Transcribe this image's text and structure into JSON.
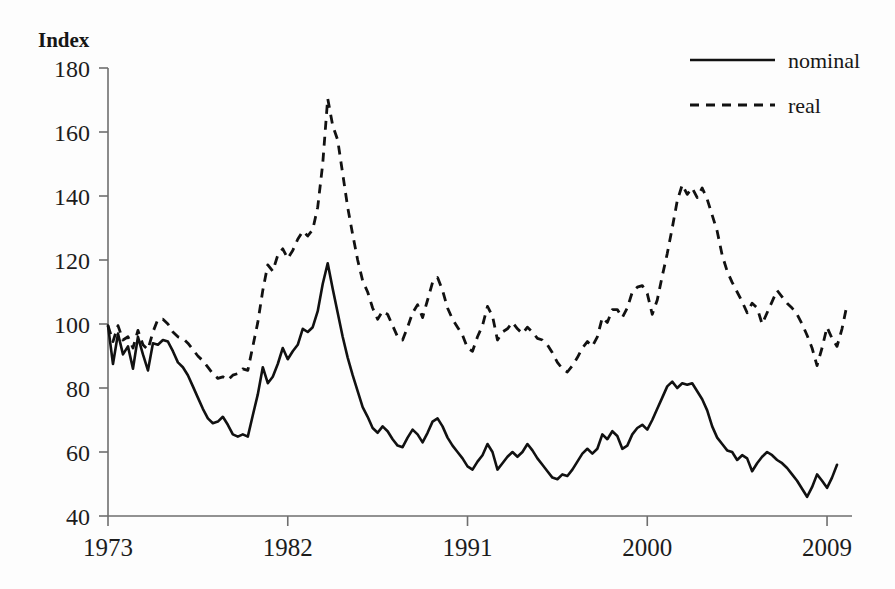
{
  "chart_data": {
    "type": "line",
    "title": "",
    "subtitle": "",
    "ylabel": "Index",
    "xlabel": "",
    "ylim": [
      40,
      180
    ],
    "xlim": [
      1973,
      2010.25
    ],
    "yticks": [
      40,
      60,
      80,
      100,
      120,
      140,
      160,
      180
    ],
    "xticks": [
      1973,
      1982,
      1991,
      2000,
      2009
    ],
    "ytick_labels": [
      "40",
      "60",
      "80",
      "100",
      "120",
      "140",
      "160",
      "180"
    ],
    "xtick_labels": [
      "1973",
      "1982",
      "1991",
      "2000",
      "2009"
    ],
    "grid": false,
    "legend_position": "top-right",
    "legend": [
      "nominal",
      "real"
    ],
    "x_start": 1973.0,
    "x_step": 0.25,
    "series": [
      {
        "name": "nominal",
        "style": "solid",
        "values": [
          99.5,
          87.5,
          97.0,
          90.5,
          93.0,
          86.0,
          96.0,
          90.5,
          85.5,
          94.0,
          93.5,
          95.0,
          94.5,
          91.5,
          88.0,
          86.5,
          84.0,
          80.5,
          77.0,
          73.5,
          70.5,
          69.0,
          69.5,
          71.0,
          68.5,
          65.5,
          64.8,
          65.5,
          64.8,
          71.5,
          78.0,
          86.5,
          81.5,
          83.5,
          87.5,
          92.5,
          89.0,
          91.5,
          93.5,
          98.5,
          97.5,
          99.0,
          104.0,
          112.5,
          119.0,
          111.0,
          103.5,
          96.0,
          89.5,
          84.0,
          79.0,
          74.0,
          71.0,
          67.5,
          66.0,
          68.0,
          66.5,
          64.0,
          62.0,
          61.5,
          64.5,
          67.0,
          65.5,
          63.0,
          66.0,
          69.5,
          70.5,
          68.0,
          64.5,
          62.0,
          60.0,
          58.0,
          55.5,
          54.5,
          57.0,
          59.0,
          62.5,
          60.0,
          54.5,
          56.5,
          58.5,
          60.0,
          58.5,
          60.0,
          62.5,
          60.5,
          58.0,
          56.0,
          54.0,
          52.0,
          51.5,
          53.0,
          52.5,
          54.5,
          57.0,
          59.5,
          61.0,
          59.5,
          61.0,
          65.5,
          64.0,
          66.5,
          65.0,
          61.0,
          62.0,
          65.5,
          67.5,
          68.5,
          67.0,
          70.0,
          73.5,
          77.0,
          80.5,
          82.0,
          80.0,
          81.5,
          81.0,
          81.5,
          79.0,
          76.5,
          73.0,
          68.0,
          64.5,
          62.5,
          60.5,
          60.0,
          57.5,
          59.0,
          58.0,
          54.0,
          56.5,
          58.5,
          60.0,
          59.0,
          57.5,
          56.5,
          55.0,
          53.0,
          51.0,
          48.5,
          46.0,
          49.0,
          53.0,
          51.0,
          48.8,
          52.0,
          56.0
        ]
      },
      {
        "name": "real",
        "style": "dashed",
        "values": [
          99.5,
          94.5,
          99.5,
          95.0,
          96.0,
          92.5,
          98.0,
          93.5,
          92.0,
          97.5,
          101.5,
          101.5,
          100.0,
          97.5,
          96.0,
          95.5,
          94.0,
          92.0,
          90.0,
          88.5,
          86.5,
          84.5,
          83.0,
          83.5,
          82.5,
          84.0,
          84.5,
          86.0,
          85.5,
          93.0,
          100.5,
          110.5,
          118.5,
          116.5,
          121.5,
          123.5,
          120.5,
          123.0,
          126.5,
          129.0,
          127.5,
          129.5,
          136.5,
          150.0,
          170.5,
          162.0,
          157.5,
          147.0,
          136.5,
          128.0,
          120.0,
          113.5,
          110.0,
          105.0,
          101.5,
          104.0,
          103.0,
          99.5,
          96.0,
          95.0,
          99.0,
          103.5,
          106.0,
          102.0,
          107.5,
          113.0,
          114.5,
          110.5,
          105.0,
          101.5,
          99.0,
          96.5,
          92.5,
          91.5,
          96.0,
          99.5,
          105.5,
          102.5,
          95.0,
          97.5,
          98.5,
          100.5,
          98.5,
          97.0,
          99.0,
          97.5,
          95.5,
          95.0,
          93.5,
          91.0,
          88.0,
          86.0,
          85.0,
          87.0,
          89.5,
          92.5,
          94.5,
          93.0,
          96.0,
          102.0,
          100.5,
          104.5,
          104.5,
          102.0,
          105.0,
          110.0,
          111.5,
          112.0,
          109.5,
          103.0,
          107.5,
          115.0,
          122.0,
          130.0,
          138.5,
          143.5,
          140.5,
          142.5,
          139.5,
          142.5,
          139.0,
          134.0,
          129.0,
          121.5,
          116.5,
          113.0,
          110.0,
          107.0,
          103.5,
          106.5,
          105.0,
          100.0,
          103.5,
          107.0,
          110.5,
          108.5,
          106.5,
          105.0,
          103.0,
          100.0,
          96.5,
          92.5,
          87.0,
          92.5,
          99.0,
          95.5,
          93.0,
          98.5,
          106.0
        ]
      }
    ]
  },
  "axis": {
    "y_title": "Index"
  },
  "legend": {
    "items": [
      {
        "label": "nominal",
        "style": "solid"
      },
      {
        "label": "real",
        "style": "dashed"
      }
    ]
  }
}
